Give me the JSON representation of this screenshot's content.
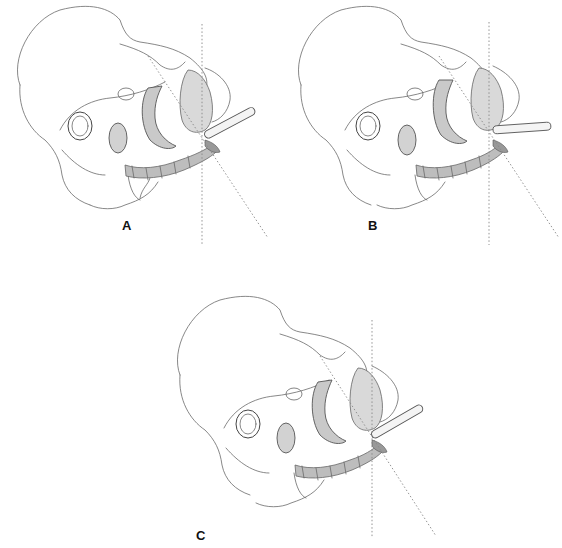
{
  "figure": {
    "colors": {
      "line": "#6a6a6a",
      "shade": "#bdbdbd",
      "guide": "#888888",
      "label": "#111111"
    },
    "panels": [
      {
        "id": "A",
        "label": "A",
        "x": 0,
        "y": 0,
        "rod_angle": -28,
        "label_x": 122,
        "label_y": 218
      },
      {
        "id": "B",
        "label": "B",
        "x": 281,
        "y": 0,
        "rod_angle": -4,
        "label_x": 368,
        "label_y": 218
      },
      {
        "id": "C",
        "label": "C",
        "x": 160,
        "y": 290,
        "rod_angle": -30,
        "label_x": 196,
        "label_y": 528
      }
    ]
  }
}
